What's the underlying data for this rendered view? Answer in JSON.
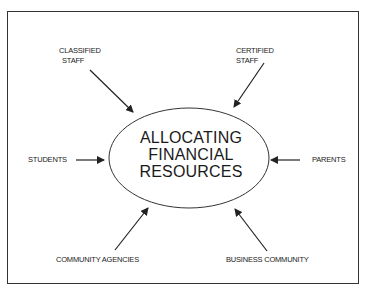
{
  "diagram": {
    "center": {
      "lines": [
        "ALLOCATING",
        "FINANCIAL",
        "RESOURCES"
      ]
    },
    "stakeholders": [
      {
        "id": "classified-staff",
        "lines": [
          "CLASSIFIED",
          "STAFF"
        ]
      },
      {
        "id": "certified-staff",
        "lines": [
          "CERTIFIED",
          "STAFF"
        ]
      },
      {
        "id": "students",
        "lines": [
          "STUDENTS"
        ]
      },
      {
        "id": "parents",
        "lines": [
          "PARENTS"
        ]
      },
      {
        "id": "community-agencies",
        "lines": [
          "COMMUNITY AGENCIES"
        ]
      },
      {
        "id": "business-community",
        "lines": [
          "BUSINESS COMMUNITY"
        ]
      }
    ],
    "colors": {
      "line": "#222222",
      "background": "#ffffff"
    }
  }
}
